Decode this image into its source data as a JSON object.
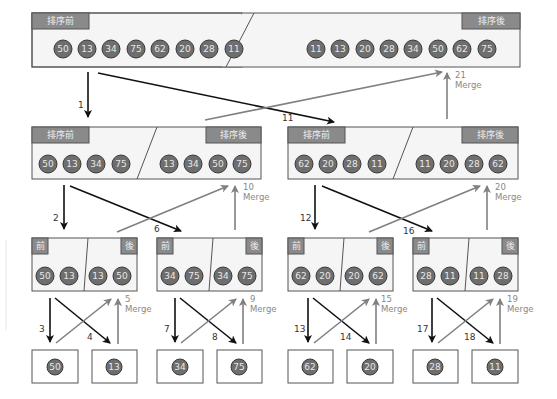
{
  "labels": {
    "before": "排序前",
    "after": "排序後",
    "before_short": "前",
    "after_short": "後",
    "merge": "Merge"
  },
  "colors": {
    "ball_fill": "#6e6e6e",
    "ball_stroke": "#3a3a3a",
    "tag_fill": "#8a8a8a",
    "box_stroke": "#555555",
    "box_fill": "#f5f5f5",
    "split_arrow": "#111111",
    "merge_arrow": "#808080"
  },
  "level0": {
    "before": [
      "50",
      "13",
      "34",
      "75",
      "62",
      "20",
      "28",
      "11"
    ],
    "after": [
      "11",
      "13",
      "20",
      "28",
      "34",
      "50",
      "62",
      "75"
    ]
  },
  "level1": [
    {
      "before": [
        "50",
        "13",
        "34",
        "75"
      ],
      "after": [
        "13",
        "34",
        "50",
        "75"
      ]
    },
    {
      "before": [
        "62",
        "20",
        "28",
        "11"
      ],
      "after": [
        "11",
        "20",
        "28",
        "62"
      ]
    }
  ],
  "level2": [
    {
      "before": [
        "50",
        "13"
      ],
      "after": [
        "13",
        "50"
      ]
    },
    {
      "before": [
        "34",
        "75"
      ],
      "after": [
        "34",
        "75"
      ]
    },
    {
      "before": [
        "62",
        "20"
      ],
      "after": [
        "20",
        "62"
      ]
    },
    {
      "before": [
        "28",
        "11"
      ],
      "after": [
        "11",
        "28"
      ]
    }
  ],
  "level3": [
    "50",
    "13",
    "34",
    "75",
    "62",
    "20",
    "28",
    "11"
  ],
  "steps": {
    "s1": "1",
    "s2": "2",
    "s3": "3",
    "s4": "4",
    "s5": "5",
    "s6": "6",
    "s7": "7",
    "s8": "8",
    "s9": "9",
    "s10": "10",
    "s11": "11",
    "s12": "12",
    "s13": "13",
    "s14": "14",
    "s15": "15",
    "s16": "16",
    "s17": "17",
    "s18": "18",
    "s19": "19",
    "s20": "20",
    "s21": "21"
  }
}
